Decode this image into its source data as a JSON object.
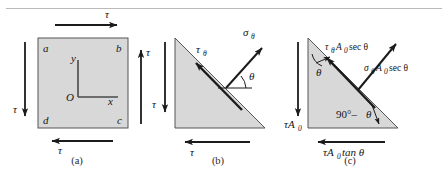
{
  "figure": {
    "type": "mechanics-shear-stress-figure",
    "background_color": "#ffffff",
    "fill_color": "#d8d8d8",
    "stroke_color": "#1b1b1b",
    "divider_color": "#b9b9b9"
  },
  "panels": [
    {
      "id": "a",
      "caption": "(a)",
      "shape": "square-element",
      "corner_labels": {
        "top_left": "a",
        "top_right": "b",
        "bottom_right": "c",
        "bottom_left": "d"
      },
      "axes": {
        "origin": "O",
        "x_label": "x",
        "y_label": "y"
      },
      "arrows": [
        {
          "name": "top-shear-arrow",
          "direction": "right",
          "label": "τ"
        },
        {
          "name": "bottom-shear-arrow",
          "direction": "left",
          "label": "τ"
        },
        {
          "name": "left-shear-arrow",
          "direction": "down",
          "label": "τ"
        },
        {
          "name": "right-shear-arrow",
          "direction": "up",
          "label": "τ"
        }
      ]
    },
    {
      "id": "b",
      "caption": "(b)",
      "shape": "right-triangle-wedge",
      "arrows": [
        {
          "name": "left-shear-arrow",
          "direction": "down",
          "label": "τ"
        },
        {
          "name": "bottom-shear-arrow",
          "direction": "left",
          "label": "τ"
        },
        {
          "name": "inclined-shear-arrow",
          "direction": "up-left",
          "label": "τθ"
        },
        {
          "name": "normal-stress-arrow",
          "direction": "up-right",
          "label": "σθ"
        }
      ],
      "angle_label": "θ",
      "labels": {
        "tau": "τ",
        "tau_theta_base": "τ",
        "tau_theta_sub": "θ",
        "sigma_theta_base": "σ",
        "sigma_theta_sub": "θ",
        "theta": "θ"
      }
    },
    {
      "id": "c",
      "caption": "(c)",
      "shape": "right-triangle-free-body",
      "arrows": [
        {
          "name": "left-force-arrow",
          "direction": "down",
          "label": "τA₀"
        },
        {
          "name": "bottom-force-arrow",
          "direction": "left",
          "label": "τA₀ tan θ"
        },
        {
          "name": "inclined-shear-force-arrow",
          "direction": "up-left",
          "label": "τθA₀ sec θ"
        },
        {
          "name": "normal-force-arrow",
          "direction": "up-right",
          "label": "σθA₀ sec θ"
        }
      ],
      "angle_labels": {
        "top": "θ",
        "bottom": "90°–θ"
      },
      "labels": {
        "tau_A0_base": "τA",
        "tau_A0_sub": "0",
        "tau_tan_base": "τA",
        "tau_tan_sub": "0",
        "tau_tan_tail": "tan θ",
        "tau_theta_base": "τ",
        "tau_theta_sub": "θ",
        "tau_theta_mid": "A",
        "tau_theta_zero": "0",
        "tau_theta_tail": "sec θ",
        "sigma_theta_base": "σ",
        "sigma_theta_sub": "θ",
        "sigma_theta_mid": "A",
        "sigma_theta_zero": "0",
        "sigma_theta_tail": "sec θ",
        "angle_top": "θ",
        "angle_bottom_deg": "90°–",
        "angle_bottom_theta": "θ"
      }
    }
  ]
}
